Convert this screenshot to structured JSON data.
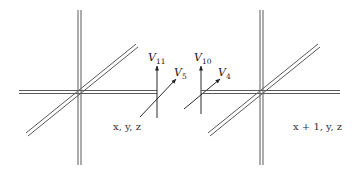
{
  "diagram": {
    "left_node": {
      "label": "x, y, z"
    },
    "right_node": {
      "label": "x + 1, y, z"
    },
    "vectors": [
      {
        "name": "V",
        "sub": "11"
      },
      {
        "name": "V",
        "sub": "5"
      },
      {
        "name": "V",
        "sub": "10"
      },
      {
        "name": "V",
        "sub": "4"
      }
    ],
    "colors": {
      "line": "#5a5a5a",
      "text": "#333333",
      "background": "#ffffff"
    }
  }
}
